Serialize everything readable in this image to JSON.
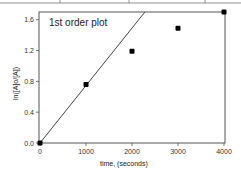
{
  "chart_data": {
    "type": "scatter",
    "title": "1st order plot",
    "xlabel": "time, (seconds)",
    "ylabel": "ln([A]o/[A])",
    "xlim": [
      0,
      4000
    ],
    "ylim": [
      0.0,
      1.7
    ],
    "x_ticks": [
      "0",
      "1000",
      "2000",
      "3000",
      "4000"
    ],
    "y_ticks": [
      "0.0",
      "0.4",
      "0.8",
      "1.2",
      "1.6"
    ],
    "grid": false,
    "legend": null,
    "series": [
      {
        "name": "data",
        "type": "scatter",
        "x": [
          0,
          1000,
          2000,
          3000,
          4000
        ],
        "y": [
          0.0,
          0.76,
          1.19,
          1.49,
          1.7
        ]
      },
      {
        "name": "fit line",
        "type": "line",
        "x": [
          0,
          2280
        ],
        "y": [
          0.0,
          1.7
        ]
      }
    ]
  }
}
